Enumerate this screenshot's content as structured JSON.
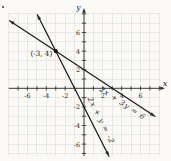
{
  "page": {
    "background": "#fbfaf7",
    "corner_mark": "dot"
  },
  "colors": {
    "line": "#1c1c1c",
    "axis": "#2a2a2a",
    "grid": "#dcdcd8",
    "text": "#232323",
    "point": "#111111"
  },
  "chart_data": {
    "type": "line",
    "title": "",
    "xlabel": "x",
    "ylabel": "y",
    "xlim": [
      -8,
      8.7
    ],
    "ylim": [
      -7.4,
      8.7
    ],
    "grid": true,
    "legend": "labels-along-lines",
    "x_tick_labels": [
      -6,
      -4,
      -2,
      2,
      4,
      6
    ],
    "y_tick_labels": [
      -6,
      -4,
      -2,
      2,
      4,
      6
    ],
    "series": [
      {
        "name": "line-2x-plus-3y-equals-6",
        "label": "2x + 3y = 6",
        "slope": -0.6666667,
        "y_intercept": 2,
        "x_intercept": 3,
        "sample_points": [
          [
            -6,
            6
          ],
          [
            -3,
            4
          ],
          [
            0,
            2
          ],
          [
            3,
            0
          ],
          [
            6,
            -2
          ]
        ]
      },
      {
        "name": "line-2x-plus-y-equals-minus-2",
        "label": "2x + y = -2",
        "slope": -2,
        "y_intercept": -2,
        "x_intercept": -1,
        "sample_points": [
          [
            -4,
            6
          ],
          [
            -3,
            4
          ],
          [
            -1,
            0
          ],
          [
            0,
            -2
          ],
          [
            2,
            -6
          ]
        ]
      }
    ],
    "intersection_point": {
      "x": -3,
      "y": 4,
      "label": "(-3, 4)"
    }
  }
}
